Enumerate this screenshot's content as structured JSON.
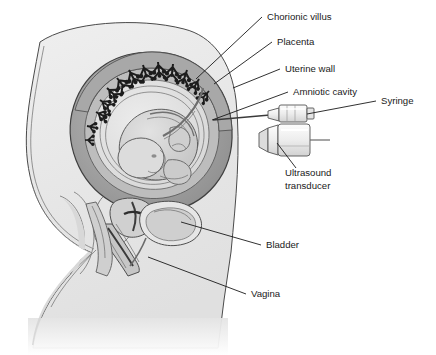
{
  "figure": {
    "type": "medical-illustration",
    "background_color": "#ffffff"
  },
  "labels": [
    {
      "id": "chorionic-villus",
      "text": "Chorionic villus",
      "x": 267,
      "y": 20,
      "anchor": "start"
    },
    {
      "id": "placenta",
      "text": "Placenta",
      "x": 277,
      "y": 45,
      "anchor": "start"
    },
    {
      "id": "uterine-wall",
      "text": "Uterine wall",
      "x": 285,
      "y": 72,
      "anchor": "start"
    },
    {
      "id": "amniotic-cavity",
      "text": "Amniotic cavity",
      "x": 293,
      "y": 95,
      "anchor": "start"
    },
    {
      "id": "syringe",
      "text": "Syringe",
      "x": 381,
      "y": 104,
      "anchor": "start"
    },
    {
      "id": "ultrasound-transducer-line1",
      "text": "Ultrasound",
      "x": 285,
      "y": 176,
      "anchor": "start"
    },
    {
      "id": "ultrasound-transducer-line2",
      "text": "transducer",
      "x": 285,
      "y": 189,
      "anchor": "start"
    },
    {
      "id": "bladder",
      "text": "Bladder",
      "x": 266,
      "y": 248,
      "anchor": "start"
    },
    {
      "id": "vagina",
      "text": "Vagina",
      "x": 251,
      "y": 297,
      "anchor": "start"
    }
  ],
  "leader_lines": [
    {
      "id": "leader-chorionic-villus",
      "d": "M262 17 L196 79"
    },
    {
      "id": "leader-placenta",
      "d": "M272 42 L214 84"
    },
    {
      "id": "leader-uterine-wall",
      "d": "M280 69 L233 88"
    },
    {
      "id": "leader-amniotic-cavity",
      "d": "M288 92 L212 120"
    },
    {
      "id": "leader-syringe",
      "d": "M376 101 L307 114"
    },
    {
      "id": "leader-ultrasound-transducer",
      "d": "M296 168 L277 143"
    },
    {
      "id": "leader-bladder",
      "d": "M261 245 L181 222"
    },
    {
      "id": "leader-vagina",
      "d": "M246 294 L148 257"
    }
  ],
  "anatomy": {
    "body_fill": "#e9e9e9",
    "body_edge": "#4a4a4a",
    "uterus_wall_fill": "#9a9a9a",
    "uterus_inner_fill": "#c9c9c9",
    "amniotic_fluid_fill": "#e3e3e3",
    "fetus_fill": "#d3d3d3",
    "villus_color": "#1c1c1c",
    "instrument_fill": "#f2f2f2",
    "instrument_edge": "#555555"
  },
  "instruments": [
    {
      "id": "syringe",
      "description": "needle and barrel entering abdomen"
    },
    {
      "id": "ultrasound-transducer",
      "description": "cylindrical probe on abdomen"
    }
  ]
}
